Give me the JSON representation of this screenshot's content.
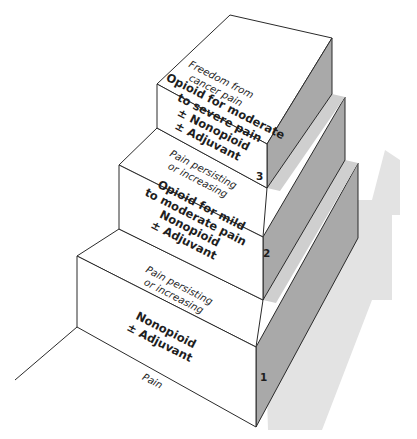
{
  "diagram": {
    "type": "staircase",
    "colors": {
      "face_front": "#ffffff",
      "face_side": "#a9a9a9",
      "side_strip": "#cfcfcf",
      "shadow": "#e2e2e2",
      "stroke": "#2a2a2a"
    },
    "base_label": "Pain",
    "steps": [
      {
        "number": "1",
        "lines": [
          "Nonopioid",
          "± Adjuvant"
        ],
        "transition_label": [
          "Pain persisting",
          "or increasing"
        ]
      },
      {
        "number": "2",
        "lines": [
          "Opioid for mild",
          "to moderate pain",
          "Nonopioid",
          "± Adjuvant"
        ],
        "transition_label": [
          "Pain persisting",
          "or increasing"
        ]
      },
      {
        "number": "3",
        "lines": [
          "Opioid for moderate",
          "to severe pain",
          "± Nonopioid",
          "± Adjuvant"
        ],
        "top_label": [
          "Freedom from",
          "cancer pain"
        ]
      }
    ]
  }
}
